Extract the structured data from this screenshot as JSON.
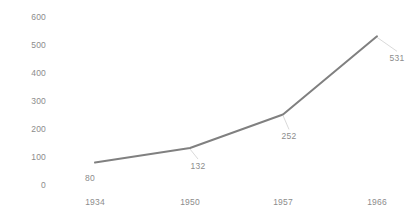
{
  "chart_data": {
    "type": "line",
    "title": "",
    "subtitle": "",
    "xlabel": "",
    "ylabel": "",
    "categories": [
      "1934",
      "1950",
      "1957",
      "1966"
    ],
    "values": [
      80,
      132,
      252,
      531
    ],
    "data_labels": [
      "80",
      "132",
      "252",
      "531"
    ],
    "series": [
      {
        "name": "",
        "values": [
          80,
          132,
          252,
          531
        ],
        "color": "#808080"
      }
    ],
    "ylim": [
      0,
      600
    ],
    "y_ticks": [
      0,
      100,
      200,
      300,
      400,
      500,
      600
    ],
    "y_tick_labels": [
      "0",
      "100",
      "200",
      "300",
      "400",
      "500",
      "600"
    ],
    "grid": false,
    "legend": false,
    "legend_position": "none",
    "markers": false,
    "background_color": "#ffffff",
    "axis_text_color": "#8c8c8c",
    "line_color": "#808080",
    "line_width": 2
  },
  "geometry": {
    "plot_left": 60,
    "plot_right": 410,
    "y_zero_px": 185,
    "px_per_100": 28.0,
    "point_x_px": [
      95,
      190,
      283,
      377
    ],
    "label_offsets": [
      {
        "dx": -5,
        "dy": 15
      },
      {
        "dx": 8,
        "dy": 18
      },
      {
        "dx": 6,
        "dy": 22
      },
      {
        "dx": 20,
        "dy": 22
      }
    ]
  }
}
